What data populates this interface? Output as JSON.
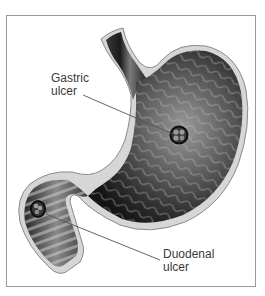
{
  "figure": {
    "labels": [
      {
        "id": "gastric",
        "line1": "Gastric",
        "line2": "ulcer"
      },
      {
        "id": "duodenal",
        "line1": "Duodenal",
        "line2": "ulcer"
      }
    ],
    "colors": {
      "frame_border": "#9a9a9a",
      "outer_wall": "#d6d6d6",
      "wall_edge": "#8a8a8a",
      "interior_dark": "#1e1e1e",
      "interior_mid": "#6a6a6a",
      "label_text": "#3a3a3a",
      "leader_line": "#555555"
    }
  }
}
